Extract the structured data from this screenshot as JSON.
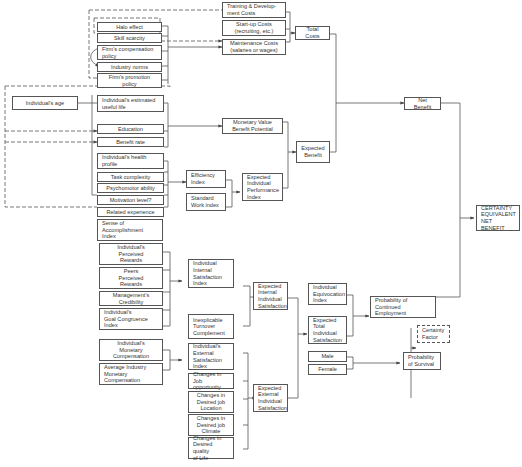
{
  "diagram": {
    "nodes": {
      "halo_effect": "Halo effect",
      "skill_scarcity": "Skill scarcity",
      "firm_compensation_policy": "Firm's compensation\npolicy",
      "industry_norms": "Industry norms",
      "firm_promotion_policy": "Firm's promotion\npolicy",
      "individual_age": "Individual's age",
      "estimated_useful_life": "Individual's estimated\nuseful life",
      "education": "Education",
      "benefit_rate": "Benefit rate",
      "health_profile": "Individual's health\nprofile",
      "task_complexity": "Task complexity",
      "psychomotor_ability": "Psychomotor ability",
      "motivation_level": "Motivation level?",
      "related_experience": "Related experience",
      "training_costs": "Training & Develop-\nment Costs",
      "startup_costs": "Start-up Costs\n(recruiting, etc.)",
      "maintenance_costs": "Maintenance Costs\n(salaries or wages)",
      "total_costs": "Total Costs",
      "monetary_value": "Monetary Value\nBenefit Potential",
      "efficiency_index": "Efficiency\nIndex",
      "standard_work_index": "Standard\nWork index",
      "expected_performance_index": "Expected\nIndividual\nPerformance\nIndex",
      "expected_benefit": "Expected\nBenefit",
      "net_benefit": "Net Benefit",
      "certainty_equivalent": "CERTAINTY\nEQUIVALENT\nNET BENEFIT",
      "sense_of_accomplishment": "Sense of\nAccomplishment\nIndex",
      "perceived_rewards": "Individual's\nPerceived\nRewards",
      "peers_perceived_rewards": "Peers\nPerceived\nRewards",
      "management_credibility": "Management's\nCredibility",
      "goal_congruence": "Individual's\nGoal Congruence\nIndex",
      "internal_satisfaction_index": "Individual\nInternal\nSatisfaction\nIndex",
      "inexplicable_turnover": "Inexplicable\nTurnover\nComplement",
      "expected_internal_satisfaction": "Expected\nInternal\nIndividual\nSatisfaction",
      "monetary_compensation": "Individual's\nMonetary\nCompensation",
      "avg_industry_compensation": "Average Industry\nMonetary\nCompensation",
      "external_satisfaction_index": "Individual's\nExternal\nSatisfaction\nIndex",
      "changes_job_opportunity": "Changes in\nJob opportunity",
      "changes_job_location": "Changes in\nDesired job\nLocation",
      "changes_job_climate": "Changes in\nDesired job\nClimate",
      "changes_quality_of_life": "Changes in\nDesired quality\nof Life",
      "expected_external_satisfaction": "Expected\nExternal\nIndividual\nSatisfaction",
      "equivocation_index": "Individual\nEquivocation\nIndex",
      "expected_total_satisfaction": "Expected\nTotal\nIndividual\nSatisfaction",
      "probability_continued_employment": "Probability of\nContinued Employment",
      "certainty_factor": "Certainty\nFactor",
      "male": "Male",
      "female": "Female",
      "probability_survival": "Probability\nof Survival"
    }
  }
}
